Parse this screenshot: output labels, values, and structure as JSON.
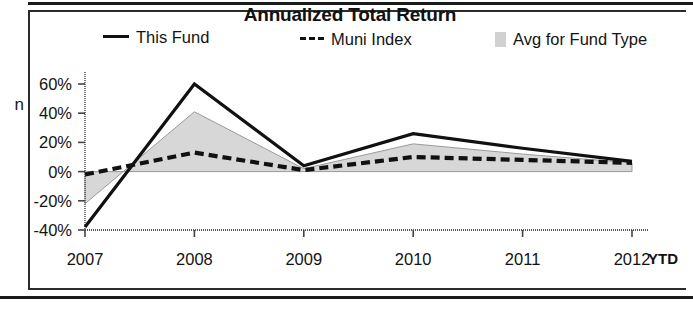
{
  "document": {
    "cut_off_left_glyph": "n"
  },
  "figure": {
    "title": "Annualized Total Return",
    "legend": [
      {
        "label": "This Fund",
        "marker": "solid-line",
        "color": "#111111"
      },
      {
        "label": "Muni Index",
        "marker": "dashed-line",
        "color": "#111111"
      },
      {
        "label": "Avg for Fund Type",
        "marker": "filled-area",
        "color": "#c9c9c9"
      }
    ],
    "axis_suffix_label": "YTD"
  },
  "chart_data": {
    "type": "line",
    "title": "Annualized Total Return",
    "xlabel": "",
    "ylabel": "",
    "categories": [
      "2007",
      "2008",
      "2009",
      "2010",
      "2011",
      "2012"
    ],
    "x_tick_labels": [
      "2007",
      "2008",
      "2009",
      "2010",
      "2011",
      "2012"
    ],
    "x_axis_note": "YTD",
    "y_tick_labels": [
      "60%",
      "40%",
      "20%",
      "0%",
      "-20%",
      "-40%"
    ],
    "y_ticks": [
      60,
      40,
      20,
      0,
      -20,
      -40
    ],
    "ylim": [
      -40,
      65
    ],
    "grid": false,
    "legend_position": "top",
    "series": [
      {
        "name": "This Fund",
        "style": "solid",
        "color": "#111111",
        "values": [
          -38,
          60,
          4,
          26,
          16,
          7
        ]
      },
      {
        "name": "Muni Index",
        "style": "dashed",
        "color": "#111111",
        "values": [
          -2,
          13,
          1,
          10,
          8,
          6
        ]
      },
      {
        "name": "Avg for Fund Type",
        "style": "area",
        "color": "#c9c9c9",
        "values": [
          -22,
          41,
          2,
          19,
          12,
          6
        ]
      }
    ]
  }
}
